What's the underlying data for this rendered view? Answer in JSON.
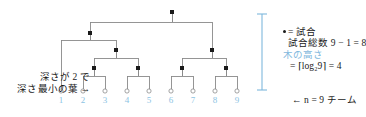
{
  "figure": {
    "colors": {
      "edge": "#8a8a8a",
      "node": "#1a1a1a",
      "leaf_outline": "#8a8a8a",
      "accent_blue": "#8cc3e3",
      "bracket_blue": "#7fb8dd",
      "text": "#1a1a1a"
    }
  },
  "annotations": {
    "left_leaf_note_line1": "深さが 2 で",
    "left_leaf_note_line2": "深さ最小の葉 →",
    "match_legend": "= 試合",
    "match_total": "試合総数 9 − 1 = 8",
    "tree_height_label": "木の高さ",
    "tree_height_formula": "= ⌈log₂9⌉ = 4",
    "teams_note": "← n = 9 チーム"
  },
  "leaves": [
    {
      "label": "1",
      "x": 61
    },
    {
      "label": "2",
      "x": 83
    },
    {
      "label": "3",
      "x": 105
    },
    {
      "label": "4",
      "x": 127
    },
    {
      "label": "5",
      "x": 149
    },
    {
      "label": "6",
      "x": 171
    },
    {
      "label": "7",
      "x": 193
    },
    {
      "label": "8",
      "x": 215
    },
    {
      "label": "9",
      "x": 237
    }
  ],
  "chart_data": {
    "type": "diagram",
    "structure": "binary-tournament-tree",
    "n_teams": 9,
    "n_matches": 8,
    "tree_height": 4,
    "min_leaf_depth": 2,
    "min_depth_leaf": "1",
    "internal_nodes": [
      {
        "id": "root",
        "x": 172,
        "y": 12,
        "depth": 0
      },
      {
        "id": "L",
        "x": 90,
        "y": 33,
        "depth": 1
      },
      {
        "id": "R",
        "x": 212,
        "y": 50,
        "depth": 1
      },
      {
        "id": "LR",
        "x": 116,
        "y": 50,
        "depth": 2
      },
      {
        "id": "LRL",
        "x": 94,
        "y": 68,
        "depth": 3
      },
      {
        "id": "LRR",
        "x": 138,
        "y": 68,
        "depth": 3
      },
      {
        "id": "RL",
        "x": 182,
        "y": 68,
        "depth": 3
      },
      {
        "id": "RR",
        "x": 226,
        "y": 68,
        "depth": 3
      }
    ],
    "leaf_depths": [
      2,
      4,
      4,
      4,
      4,
      4,
      4,
      4,
      4
    ]
  }
}
